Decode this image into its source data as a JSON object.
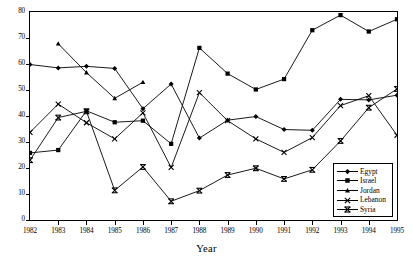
{
  "chart_data": {
    "type": "line",
    "title": "",
    "xlabel": "Year",
    "ylabel": "",
    "x": [
      1982,
      1983,
      1984,
      1985,
      1986,
      1987,
      1988,
      1989,
      1990,
      1991,
      1992,
      1993,
      1994,
      1995
    ],
    "xlim": [
      1982,
      1995
    ],
    "ylim": [
      0,
      80
    ],
    "yticks": [
      0,
      10,
      20,
      30,
      40,
      50,
      60,
      70,
      80
    ],
    "xticks": [
      "1982",
      "1983",
      "1984",
      "1985",
      "1986",
      "1987",
      "1988",
      "1989",
      "1990",
      "1991",
      "1992",
      "1993",
      "1994",
      "1995"
    ],
    "grid": false,
    "legend_position": "lower right",
    "series": [
      {
        "name": "Egypt",
        "marker": "diamond",
        "values": [
          59.8,
          58.5,
          59.1,
          58.3,
          42.8,
          52.3,
          31.5,
          38.4,
          39.8,
          34.8,
          34.5,
          46.4,
          46.2,
          48.0
        ]
      },
      {
        "name": "Israel",
        "marker": "square",
        "values": [
          25.8,
          26.9,
          42.0,
          37.6,
          38.2,
          29.3,
          66.2,
          56.3,
          50.2,
          54.2,
          73.0,
          78.8,
          72.5,
          77.2
        ]
      },
      {
        "name": "Jordan",
        "marker": "triangle",
        "values": [
          null,
          67.8,
          56.7,
          46.8,
          53.0,
          null,
          null,
          null,
          null,
          null,
          null,
          null,
          null,
          null
        ]
      },
      {
        "name": "Lebanon",
        "marker": "x",
        "values": [
          33.7,
          44.6,
          37.4,
          31.2,
          41.2,
          20.2,
          49.0,
          38.2,
          31.2,
          26.0,
          31.7,
          44.0,
          47.8,
          32.6
        ]
      },
      {
        "name": "Syria",
        "marker": "star",
        "values": [
          23.0,
          39.4,
          41.8,
          11.4,
          20.4,
          7.2,
          11.3,
          17.3,
          19.9,
          15.8,
          19.3,
          30.4,
          43.2,
          50.4
        ]
      }
    ]
  },
  "legend": {
    "items": [
      {
        "label": "Egypt"
      },
      {
        "label": "Israel"
      },
      {
        "label": "Jordan"
      },
      {
        "label": "Lebanon"
      },
      {
        "label": "Syria"
      }
    ]
  },
  "axes": {
    "x_axis_label": "Year"
  }
}
